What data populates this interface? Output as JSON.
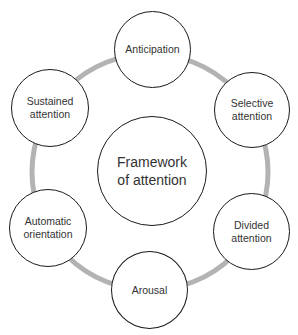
{
  "diagram": {
    "center": {
      "label_line1": "Framework",
      "label_line2": "of attention"
    },
    "ring_color": "#b3b3b3",
    "nodes": [
      {
        "id": "anticipation",
        "line1": "Anticipation",
        "line2": ""
      },
      {
        "id": "selective-attention",
        "line1": "Selective",
        "line2": "attention"
      },
      {
        "id": "divided-attention",
        "line1": "Divided",
        "line2": "attention"
      },
      {
        "id": "arousal",
        "line1": "Arousal",
        "line2": ""
      },
      {
        "id": "automatic-orientation",
        "line1": "Automatic",
        "line2": "orientation"
      },
      {
        "id": "sustained-attention",
        "line1": "Sustained",
        "line2": "attention"
      }
    ]
  }
}
